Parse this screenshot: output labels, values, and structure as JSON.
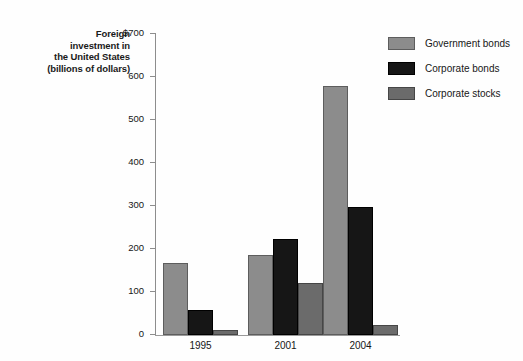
{
  "chart_data": {
    "type": "bar",
    "title": "",
    "xlabel": "",
    "ylabel": "Foreign investment in the United States (billions of dollars)",
    "ylabel_lines": [
      "Foreign",
      "investment in",
      "the United States",
      "(billions of dollars)"
    ],
    "categories": [
      "1995",
      "2001",
      "2004"
    ],
    "series": [
      {
        "name": "Government bonds",
        "color": "#8c8c8c",
        "values": [
          168,
          185,
          578
        ]
      },
      {
        "name": "Corporate bonds",
        "color": "#161616",
        "values": [
          58,
          224,
          297
        ]
      },
      {
        "name": "Corporate stocks",
        "color": "#6b6b6b",
        "values": [
          11,
          120,
          24
        ]
      }
    ],
    "ylim": [
      0,
      700
    ],
    "yticks": [
      0,
      100,
      200,
      300,
      400,
      500,
      600,
      700
    ],
    "ytick_labels": [
      "0",
      "100",
      "200",
      "300",
      "400",
      "500",
      "600",
      "$700"
    ],
    "grid": false,
    "legend_position": "top-right"
  },
  "legend": {
    "entries": [
      {
        "label": "Government bonds"
      },
      {
        "label": "Corporate bonds"
      },
      {
        "label": "Corporate stocks"
      }
    ]
  }
}
